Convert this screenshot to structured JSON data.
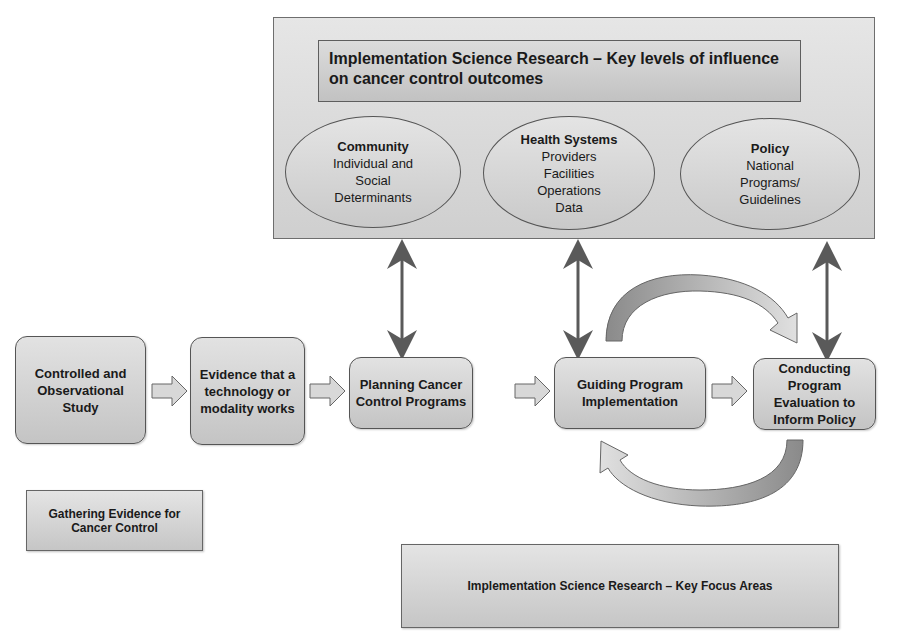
{
  "top_panel": {
    "title": "Implementation Science Research – Key levels of influence on cancer control outcomes",
    "levels": [
      {
        "heading": "Community",
        "lines": [
          "Individual and",
          "Social",
          "Determinants"
        ]
      },
      {
        "heading": "Health Systems",
        "lines": [
          "Providers",
          "Facilities",
          "Operations",
          "Data"
        ]
      },
      {
        "heading": "Policy",
        "lines": [
          "National",
          "Programs/",
          "Guidelines"
        ]
      }
    ]
  },
  "steps": [
    {
      "label": "Controlled and Observational Study"
    },
    {
      "label": "Evidence that a technology or modality works"
    },
    {
      "label": "Planning Cancer Control Programs"
    },
    {
      "label": "Guiding Program Implementation"
    },
    {
      "label": "Conducting Program Evaluation to Inform Policy"
    }
  ],
  "bottom_labels": {
    "gathering": "Gathering Evidence for Cancer Control",
    "focus_areas": "Implementation Science Research – Key Focus Areas"
  },
  "colors": {
    "box_fill": "#d4d4d4",
    "border": "#555555",
    "arrow": "#5a5a5a"
  }
}
